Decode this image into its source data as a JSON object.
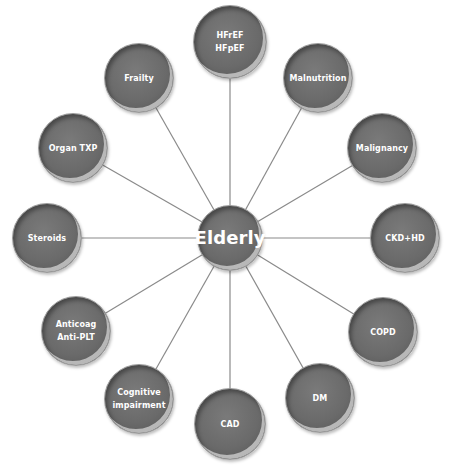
{
  "diagram": {
    "type": "radial-hub",
    "center": {
      "label": "Elderly",
      "x": 230,
      "y": 238,
      "r": 33
    },
    "nodes": [
      {
        "id": "hf",
        "lines": [
          "HFrEF",
          "HFpEF"
        ],
        "x": 230,
        "y": 42,
        "r": 37
      },
      {
        "id": "malnut",
        "lines": [
          "Malnutrition"
        ],
        "x": 318,
        "y": 78,
        "r": 35
      },
      {
        "id": "malig",
        "lines": [
          "Malignancy"
        ],
        "x": 382,
        "y": 148,
        "r": 35
      },
      {
        "id": "ckd",
        "lines": [
          "CKD+HD"
        ],
        "x": 405,
        "y": 238,
        "r": 35
      },
      {
        "id": "copd",
        "lines": [
          "COPD"
        ],
        "x": 383,
        "y": 332,
        "r": 35
      },
      {
        "id": "dm",
        "lines": [
          "DM"
        ],
        "x": 320,
        "y": 398,
        "r": 35
      },
      {
        "id": "cad",
        "lines": [
          "CAD"
        ],
        "x": 230,
        "y": 424,
        "r": 36
      },
      {
        "id": "cognitive",
        "lines": [
          "Cognitive",
          "impairment"
        ],
        "x": 139,
        "y": 399,
        "r": 35
      },
      {
        "id": "anticoag",
        "lines": [
          "Anticoag",
          "Anti-PLT"
        ],
        "x": 76,
        "y": 331,
        "r": 35
      },
      {
        "id": "steroids",
        "lines": [
          "Steroids"
        ],
        "x": 47,
        "y": 238,
        "r": 35
      },
      {
        "id": "organtxp",
        "lines": [
          "Organ TXP"
        ],
        "x": 73,
        "y": 148,
        "r": 35
      },
      {
        "id": "frailty",
        "lines": [
          "Frailty"
        ],
        "x": 139,
        "y": 78,
        "r": 35
      }
    ],
    "colors": {
      "node_fill": "#6a6a6a",
      "line": "#8a8a8a",
      "text": "#ffffff",
      "background": "#ffffff"
    }
  }
}
